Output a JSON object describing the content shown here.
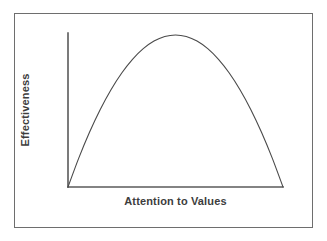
{
  "figure": {
    "background_color": "#ffffff",
    "border_color": "#6e6e6e",
    "axis_color": "#5a5a5a",
    "curve_color": "#4a4a4a",
    "label_color": "#3d3d3d"
  },
  "axes": {
    "x_axis_label": "Attention to Values",
    "y_axis_label": "Effectiveness"
  },
  "chart_data": {
    "type": "line",
    "title": "",
    "subtitle": "",
    "xlabel": "Attention to Values",
    "ylabel": "Effectiveness",
    "xlim": [
      0,
      1
    ],
    "ylim": [
      0,
      1
    ],
    "grid": false,
    "legend": false,
    "legend_position": "none",
    "x_tick_labels": [],
    "y_tick_labels": [],
    "annotations": [],
    "series": [
      {
        "name": "Effectiveness vs Attention to Values",
        "shape": "inverted-u-parabola",
        "peak_x": 0.5,
        "peak_y": 1.0,
        "x": [
          0.0,
          0.05,
          0.1,
          0.15,
          0.2,
          0.25,
          0.3,
          0.35,
          0.4,
          0.45,
          0.5,
          0.55,
          0.6,
          0.65,
          0.7,
          0.75,
          0.8,
          0.85,
          0.9,
          0.95,
          1.0
        ],
        "values": [
          0.0,
          0.19,
          0.36,
          0.51,
          0.64,
          0.75,
          0.84,
          0.91,
          0.96,
          0.99,
          1.0,
          0.99,
          0.96,
          0.91,
          0.84,
          0.75,
          0.64,
          0.51,
          0.36,
          0.19,
          0.0
        ]
      }
    ]
  }
}
